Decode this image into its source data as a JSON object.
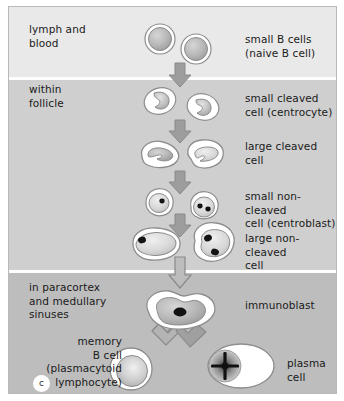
{
  "figure": {
    "panel_label": "c",
    "background_colors": {
      "lymph_band": "#e9e9e9",
      "follicle_band": "#cfcfcf",
      "paracortex_band": "#bdbdbd",
      "divider": "#ffffff",
      "frame": "#b9b9b9",
      "page": "#ffffff"
    },
    "ink": {
      "text": "#1a1a1a",
      "cell_outline": "#8d8d8d",
      "cytoplasm": "#ffffff",
      "nucleus_light": "#c9c9c9",
      "nucleus_mid": "#a8a8a8",
      "nucleolus": "#111111",
      "arrow_fill": "#9d9d9d",
      "arrow_outline": "#8a8a8a"
    }
  },
  "compartments": [
    {
      "id": "lymph-and-blood",
      "label": "lymph and\nblood"
    },
    {
      "id": "within-follicle",
      "label": "within\nfollicle"
    },
    {
      "id": "paracortex-and-medullary-sinuses",
      "label": "in paracortex\nand medullary\nsinuses"
    }
  ],
  "stages": [
    {
      "id": "small-b-cells",
      "label": "small B cells\n(naive B cell)"
    },
    {
      "id": "small-cleaved-cell",
      "label": "small cleaved\ncell (centrocyte)"
    },
    {
      "id": "large-cleaved-cell",
      "label": "large cleaved\ncell"
    },
    {
      "id": "small-non-cleaved-cell",
      "label": "small non-cleaved\ncell (centroblast)"
    },
    {
      "id": "large-non-cleaved-cell",
      "label": "large non-cleaved\ncell"
    },
    {
      "id": "immunoblast",
      "label": "immunoblast"
    },
    {
      "id": "memory-b-cell",
      "label": "memory\nB cell\n(plasmacytoid\nlymphocyte)"
    },
    {
      "id": "plasma-cell",
      "label": "plasma\ncell"
    }
  ]
}
